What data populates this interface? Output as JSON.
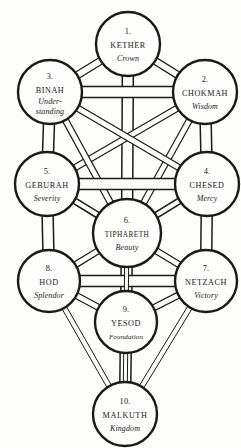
{
  "diagram": {
    "stroke_color": "#1a1a1a",
    "fill_color": "#fdfdfb",
    "background": "#ffffff"
  },
  "sephiroth": [
    {
      "id": "kether",
      "number": "1.",
      "name": "Kether",
      "meaning": "Crown",
      "meaning_line2": "",
      "cx": 128,
      "cy": 44,
      "r": 32
    },
    {
      "id": "chokmah",
      "number": "2.",
      "name": "Chokmah",
      "meaning": "Wisdom",
      "meaning_line2": "",
      "cx": 205,
      "cy": 92,
      "r": 32
    },
    {
      "id": "binah",
      "number": "3.",
      "name": "Binah",
      "meaning": "Under-",
      "meaning_line2": "standing",
      "cx": 50,
      "cy": 92,
      "r": 32
    },
    {
      "id": "chesed",
      "number": "4.",
      "name": "Chesed",
      "meaning": "Mercy",
      "meaning_line2": "",
      "cx": 207,
      "cy": 184,
      "r": 32
    },
    {
      "id": "geburah",
      "number": "5.",
      "name": "Geburah",
      "meaning": "Severity",
      "meaning_line2": "",
      "cx": 47,
      "cy": 184,
      "r": 32
    },
    {
      "id": "tiphareth",
      "number": "6.",
      "name": "Tiphareth",
      "meaning": "Beauty",
      "meaning_line2": "",
      "cx": 127,
      "cy": 233,
      "r": 34
    },
    {
      "id": "netzach",
      "number": "7.",
      "name": "Netzach",
      "meaning": "Victory",
      "meaning_line2": "",
      "cx": 206,
      "cy": 281,
      "r": 31
    },
    {
      "id": "hod",
      "number": "8.",
      "name": "Hod",
      "meaning": "Splendor",
      "meaning_line2": "",
      "cx": 49,
      "cy": 281,
      "r": 31
    },
    {
      "id": "yesod",
      "number": "9.",
      "name": "Yesod",
      "meaning": "Foundation",
      "meaning_line2": "",
      "cx": 126,
      "cy": 322,
      "r": 31
    },
    {
      "id": "malkuth",
      "number": "10.",
      "name": "Malkuth",
      "meaning": "Kingdom",
      "meaning_line2": "",
      "cx": 125,
      "cy": 414,
      "r": 32
    }
  ],
  "paths": [
    {
      "from": "kether",
      "to": "chokmah",
      "width": 7
    },
    {
      "from": "kether",
      "to": "binah",
      "width": 7
    },
    {
      "from": "kether",
      "to": "tiphareth",
      "width": 11
    },
    {
      "from": "chokmah",
      "to": "binah",
      "width": 11
    },
    {
      "from": "chokmah",
      "to": "chesed",
      "width": 11
    },
    {
      "from": "chokmah",
      "to": "geburah",
      "width": 6
    },
    {
      "from": "chokmah",
      "to": "tiphareth",
      "width": 6
    },
    {
      "from": "binah",
      "to": "geburah",
      "width": 11
    },
    {
      "from": "binah",
      "to": "chesed",
      "width": 6
    },
    {
      "from": "binah",
      "to": "tiphareth",
      "width": 6
    },
    {
      "from": "chesed",
      "to": "geburah",
      "width": 11
    },
    {
      "from": "chesed",
      "to": "tiphareth",
      "width": 6
    },
    {
      "from": "chesed",
      "to": "netzach",
      "width": 11
    },
    {
      "from": "geburah",
      "to": "tiphareth",
      "width": 6
    },
    {
      "from": "geburah",
      "to": "hod",
      "width": 11
    },
    {
      "from": "geburah",
      "to": "netzach",
      "width": 5
    },
    {
      "from": "chesed",
      "to": "hod",
      "width": 5
    },
    {
      "from": "tiphareth",
      "to": "netzach",
      "width": 6
    },
    {
      "from": "tiphareth",
      "to": "hod",
      "width": 6
    },
    {
      "from": "tiphareth",
      "to": "yesod",
      "width": 11
    },
    {
      "from": "netzach",
      "to": "hod",
      "width": 11
    },
    {
      "from": "netzach",
      "to": "yesod",
      "width": 6
    },
    {
      "from": "netzach",
      "to": "malkuth",
      "width": 5
    },
    {
      "from": "hod",
      "to": "yesod",
      "width": 6
    },
    {
      "from": "hod",
      "to": "malkuth",
      "width": 5
    },
    {
      "from": "yesod",
      "to": "malkuth",
      "width": 11
    },
    {
      "from": "tiphareth",
      "to": "malkuth",
      "width": 4
    }
  ]
}
